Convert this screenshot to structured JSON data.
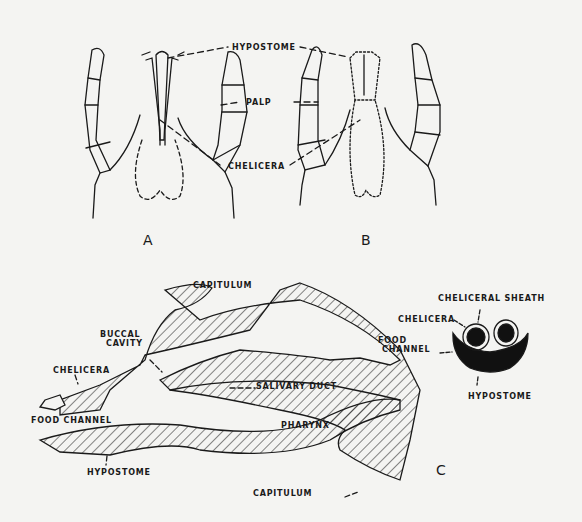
{
  "figure": {
    "panel_a": {
      "letter": "A"
    },
    "panel_b": {
      "letter": "B"
    },
    "panel_c": {
      "letter": "C"
    },
    "labels_ab": {
      "hypostome": "HYPOSTOME",
      "palp": "PALP",
      "chelicera": "CHELICERA"
    },
    "labels_c": {
      "capitulum_top": "CAPITULUM",
      "buccal_cavity_1": "BUCCAL",
      "buccal_cavity_2": "CAVITY",
      "chelicera": "CHELICERA",
      "salivary_duct": "SALIVARY DUCT",
      "food_channel": "FOOD CHANNEL",
      "pharynx": "PHARYNX",
      "hypostome": "HYPOSTOME",
      "capitulum_bottom": "CAPITULUM"
    },
    "labels_section": {
      "cheliceral_sheath": "CHELICERAL SHEATH",
      "chelicera": "CHELICERA",
      "food_1": "FOOD",
      "food_2": "CHANNEL",
      "hypostome": "HYPOSTOME"
    }
  }
}
